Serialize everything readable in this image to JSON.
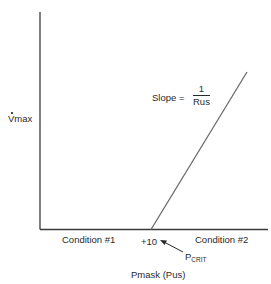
{
  "diagram": {
    "y_axis_label": "Vmax",
    "y_axis_label_dot": true,
    "x_axis_label": "Pmask (Pus)",
    "slope_label": {
      "prefix": "Slope =",
      "numerator": "1",
      "denominator": "Rus"
    },
    "regions": [
      {
        "label": "Condition #1"
      },
      {
        "label": "Condition #2"
      }
    ],
    "threshold": {
      "value_label": "+10",
      "annotation_main": "P",
      "annotation_sub": "CRIT"
    },
    "colors": {
      "axis": "#3a3a3a",
      "line": "#6b6b6b",
      "text": "#2a2a2a"
    }
  }
}
